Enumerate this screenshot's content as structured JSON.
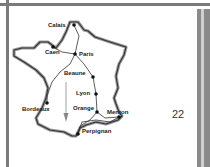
{
  "map": {
    "region": "France",
    "outline_color": "#444444",
    "route_color": "#333333",
    "arrow_color": "#888888",
    "cities": [
      {
        "name": "Calais",
        "x": 74,
        "y": 25,
        "lx": 48,
        "ly": 22
      },
      {
        "name": "Caen",
        "x": 53,
        "y": 47,
        "lx": 45,
        "ly": 49
      },
      {
        "name": "Paris",
        "x": 75,
        "y": 54,
        "lx": 79,
        "ly": 51
      },
      {
        "name": "Beaune",
        "x": 93,
        "y": 77,
        "lx": 64,
        "ly": 70
      },
      {
        "name": "Lyon",
        "x": 96,
        "y": 94,
        "lx": 76,
        "ly": 90
      },
      {
        "name": "Bordeaux",
        "x": 47,
        "y": 103,
        "lx": 22,
        "ly": 106
      },
      {
        "name": "Orange",
        "x": 97,
        "y": 112,
        "lx": 73,
        "ly": 105
      },
      {
        "name": "Menton",
        "x": 119,
        "y": 117,
        "lx": 107,
        "ly": 109
      },
      {
        "name": "Perpignan",
        "x": 78,
        "y": 134,
        "lx": 82,
        "ly": 128
      }
    ]
  },
  "page": {
    "number": "22"
  }
}
